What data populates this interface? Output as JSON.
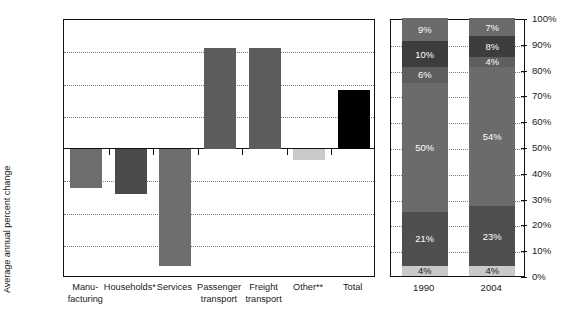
{
  "chart_data": [
    {
      "type": "bar",
      "title": "",
      "xlabel": "",
      "ylabel": "Average annual percent change",
      "ylim": [
        -2.0,
        2.0
      ],
      "ytick_values": [
        2.0,
        1.5,
        1.0,
        0.5,
        0.0,
        -0.5,
        -1.0,
        -1.5,
        -2.0
      ],
      "ytick_labels": [
        "2.0%",
        "1.5%",
        "1.0%",
        "0.5%",
        "0.0%",
        "–0.5%",
        "–1.0%",
        "–1.5%",
        "–2.0%"
      ],
      "grid": true,
      "legend": "none",
      "categories": [
        "Manu-\nfacturing",
        "Households*",
        "Services",
        "Passenger\ntransport",
        "Freight\ntransport",
        "Other**",
        "Total"
      ],
      "category_lines": [
        [
          "Manu-",
          "facturing"
        ],
        [
          "Households*"
        ],
        [
          "Services"
        ],
        [
          "Passenger",
          "transport"
        ],
        [
          "Freight",
          "transport"
        ],
        [
          "Other**"
        ],
        [
          "Total"
        ]
      ],
      "values": [
        -0.6,
        -0.7,
        -1.81,
        1.57,
        1.56,
        -0.17,
        0.91
      ],
      "bar_colors": [
        "#6e6e6e",
        "#4a4a4a",
        "#6e6e6e",
        "#5c5c5c",
        "#5c5c5c",
        "#c9c9c9",
        "#000000"
      ]
    },
    {
      "type": "bar",
      "subtype": "stacked-percent",
      "title": "",
      "xlabel": "",
      "ylabel": "",
      "ylim": [
        0,
        100
      ],
      "ytick_values": [
        100,
        90,
        80,
        70,
        60,
        50,
        40,
        30,
        20,
        10,
        0
      ],
      "ytick_labels": [
        "100%",
        "90%",
        "80%",
        "70%",
        "60%",
        "50%",
        "40%",
        "30%",
        "20%",
        "10%",
        "0%"
      ],
      "grid": true,
      "legend": "none",
      "categories": [
        "1990",
        "2004"
      ],
      "stacks": [
        {
          "category": "1990",
          "segments": [
            {
              "label": "4%",
              "value": 4,
              "color": "#c9c9c9",
              "text_color": "dark"
            },
            {
              "label": "21%",
              "value": 21,
              "color": "#4f4f4f",
              "text_color": "light"
            },
            {
              "label": "50%",
              "value": 50,
              "color": "#6b6b6b",
              "text_color": "light"
            },
            {
              "label": "6%",
              "value": 6,
              "color": "#5e5e5e",
              "text_color": "light"
            },
            {
              "label": "10%",
              "value": 10,
              "color": "#3d3d3d",
              "text_color": "light"
            },
            {
              "label": "9%",
              "value": 9,
              "color": "#6b6b6b",
              "text_color": "light"
            }
          ]
        },
        {
          "category": "2004",
          "segments": [
            {
              "label": "4%",
              "value": 4,
              "color": "#c9c9c9",
              "text_color": "dark"
            },
            {
              "label": "23%",
              "value": 23,
              "color": "#4f4f4f",
              "text_color": "light"
            },
            {
              "label": "54%",
              "value": 54,
              "color": "#6b6b6b",
              "text_color": "light"
            },
            {
              "label": "4%",
              "value": 4,
              "color": "#5e5e5e",
              "text_color": "light"
            },
            {
              "label": "8%",
              "value": 8,
              "color": "#3d3d3d",
              "text_color": "light"
            },
            {
              "label": "7%",
              "value": 7,
              "color": "#6b6b6b",
              "text_color": "light"
            }
          ]
        }
      ]
    }
  ]
}
